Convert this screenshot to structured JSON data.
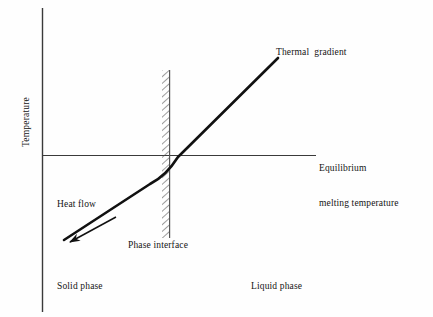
{
  "figure": {
    "type": "schematic-diagram",
    "background_color": "#fefefe",
    "ink_color": "#141414",
    "axis": {
      "y_axis_label": "Temperature"
    },
    "labels": {
      "thermal_gradient": "Thermal  gradient",
      "equilibrium_line_1": "Equilibrium",
      "equilibrium_line_2": "melting temperature",
      "heat_flow": "Heat flow",
      "phase_interface": "Phase interface",
      "solid_phase": "Solid phase",
      "liquid_phase": "Liquid phase"
    },
    "elements": {
      "y_axis": {
        "x": 42,
        "y_top": 8,
        "y_bottom": 312,
        "color": "#3a3a3a"
      },
      "equilibrium_line": {
        "y": 155,
        "x_start": 42,
        "x_end": 316,
        "color": "#3a3a3a"
      },
      "phase_interface_band": {
        "x_left": 162,
        "x_right": 170,
        "y_top": 70,
        "y_bottom": 238,
        "hatch": "diagonal",
        "edge_color": "#555555"
      },
      "thermal_gradient_curve": {
        "description": "kinked line, shallow slope in solid, steeper slope in liquid",
        "points": [
          [
            64,
            240
          ],
          [
            166,
            174
          ],
          [
            192,
            139
          ],
          [
            278,
            58
          ]
        ],
        "stroke_width": 2.6,
        "color": "#111111"
      },
      "heat_flow_arrow": {
        "from": [
          116,
          218
        ],
        "to": [
          67,
          243
        ],
        "direction": "down-left",
        "arrowhead": "solid-filled",
        "color": "#111111"
      }
    }
  }
}
